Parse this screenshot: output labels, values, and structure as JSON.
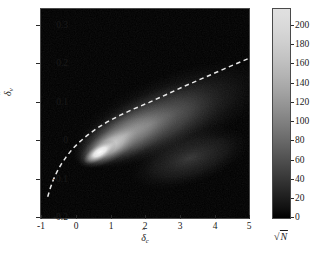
{
  "chart_data": {
    "type": "heatmap",
    "title": "",
    "xlabel": "δ̂_c",
    "ylabel": "δ̂_v",
    "xlabel_parts": {
      "symbol": "δ",
      "hat": "ˆ",
      "subscript": "c"
    },
    "ylabel_parts": {
      "symbol": "δ",
      "hat": "ˆ",
      "subscript": "v"
    },
    "xlim": [
      -1,
      5
    ],
    "ylim": [
      -0.2,
      0.35
    ],
    "xticks": [
      -1,
      0,
      1,
      2,
      3,
      4,
      5
    ],
    "xticklabels": [
      "-1",
      "0",
      "1",
      "2",
      "3",
      "4",
      "5"
    ],
    "yticks": [
      0.3,
      0.2,
      0.1,
      0,
      -0.1,
      -0.2
    ],
    "yticklabels": [
      "0.3",
      "0.2",
      "0.1",
      "0",
      "-0.1",
      "-0.2"
    ],
    "grid": false,
    "colormap": "gray",
    "colorbar": {
      "label": "√N",
      "label_parts": {
        "radical": "√",
        "symbol": "N"
      },
      "min": 0,
      "max": 210,
      "ticks": [
        0,
        20,
        40,
        60,
        80,
        100,
        120,
        140,
        160,
        180,
        200
      ],
      "ticklabels": [
        "0",
        "20",
        "40",
        "60",
        "80",
        "100",
        "120",
        "140",
        "160",
        "180",
        "200"
      ],
      "position": "right",
      "orientation": "vertical"
    },
    "density_peak": {
      "x": 0.7,
      "y": 0.02,
      "value": 210
    },
    "density_blobs": [
      {
        "cx": 0.72,
        "cy": 0.015,
        "rx": 0.95,
        "ry": 0.042,
        "rot": -32,
        "intensity": 1.0
      },
      {
        "cx": 0.95,
        "cy": 0.035,
        "rx": 1.75,
        "ry": 0.075,
        "rot": -30,
        "intensity": 0.72
      },
      {
        "cx": 1.45,
        "cy": 0.065,
        "rx": 2.9,
        "ry": 0.115,
        "rot": -27,
        "intensity": 0.46
      },
      {
        "cx": 2.1,
        "cy": 0.095,
        "rx": 4.1,
        "ry": 0.155,
        "rot": -24,
        "intensity": 0.26
      },
      {
        "cx": 2.7,
        "cy": 0.115,
        "rx": 5.4,
        "ry": 0.2,
        "rot": -22,
        "intensity": 0.14
      }
    ],
    "curve": {
      "style": "dashed",
      "color": "#e8e8e8",
      "points": [
        [
          -0.78,
          -0.142
        ],
        [
          -0.7,
          -0.118
        ],
        [
          -0.62,
          -0.098
        ],
        [
          -0.52,
          -0.078
        ],
        [
          -0.4,
          -0.058
        ],
        [
          -0.25,
          -0.038
        ],
        [
          -0.08,
          -0.018
        ],
        [
          0.12,
          0.0
        ],
        [
          0.35,
          0.018
        ],
        [
          0.62,
          0.036
        ],
        [
          0.92,
          0.053
        ],
        [
          1.28,
          0.07
        ],
        [
          1.68,
          0.087
        ],
        [
          2.12,
          0.104
        ],
        [
          2.6,
          0.124
        ],
        [
          3.12,
          0.146
        ],
        [
          3.68,
          0.168
        ],
        [
          4.28,
          0.192
        ],
        [
          5.0,
          0.22
        ]
      ]
    },
    "axes_background": "#000000",
    "figure_background": "#ffffff"
  }
}
